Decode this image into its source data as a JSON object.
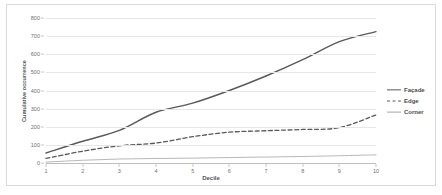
{
  "chart_data": {
    "type": "line",
    "title": "",
    "xlabel": "Decile",
    "ylabel": "Cumulative occurrence",
    "x": [
      1,
      2,
      3,
      4,
      5,
      6,
      7,
      8,
      9,
      10
    ],
    "categories": [
      "1",
      "2",
      "3",
      "4",
      "5",
      "6",
      "7",
      "8",
      "9",
      "10"
    ],
    "xlim": [
      1,
      10
    ],
    "ylim": [
      0,
      800
    ],
    "yticks": [
      0,
      100,
      200,
      300,
      400,
      500,
      600,
      700,
      800
    ],
    "ytick_labels": [
      "0",
      "100",
      "200",
      "300",
      "400",
      "500",
      "600",
      "700",
      "800"
    ],
    "grid": "horizontal",
    "legend_position": "right",
    "series": [
      {
        "name": "Façade",
        "style": "solid",
        "color": "#595959",
        "values": [
          55,
          120,
          180,
          280,
          330,
          400,
          480,
          570,
          670,
          725
        ]
      },
      {
        "name": "Edge",
        "style": "dashed",
        "color": "#595959",
        "values": [
          25,
          65,
          95,
          110,
          145,
          170,
          178,
          185,
          195,
          265
        ]
      },
      {
        "name": "Corner",
        "style": "solid-thin",
        "color": "#a6a6a6",
        "values": [
          5,
          15,
          22,
          25,
          27,
          30,
          33,
          36,
          40,
          45
        ]
      }
    ]
  },
  "legend": {
    "items": [
      {
        "label": "Façade"
      },
      {
        "label": "Edge"
      },
      {
        "label": "Corner"
      }
    ]
  },
  "axes": {
    "x_title": "Decile",
    "y_title": "Cumulative occurrence"
  }
}
